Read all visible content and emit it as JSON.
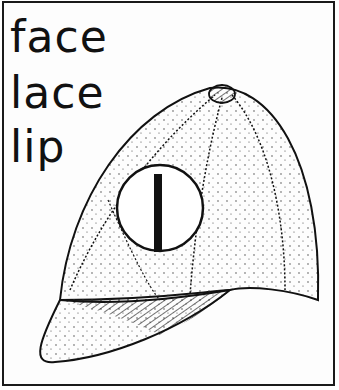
{
  "words": [
    "face",
    "lace",
    "lip"
  ],
  "badge": {
    "letter": "l"
  },
  "illustration": {
    "subject": "cap-illustration",
    "stroke_color": "#111111",
    "background": "#ffffff"
  }
}
